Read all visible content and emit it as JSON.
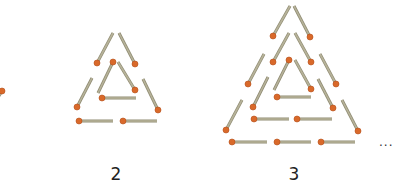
{
  "figure": {
    "colors": {
      "stick": "#b7b39a",
      "stick_edge": "#8f8b72",
      "head": "#d9692a",
      "head_dark": "#b44e18",
      "text": "#222222"
    },
    "ellipsis": "...",
    "patterns": [
      {
        "id": "pattern-1",
        "label": "",
        "partial": true,
        "matches": [
          {
            "head": [
              2,
              91
            ],
            "tail": [
              -6,
              104
            ]
          }
        ]
      },
      {
        "id": "pattern-2",
        "label": "2",
        "label_pos": [
          116,
          166
        ],
        "matches": [
          {
            "head": [
              97,
              63
            ],
            "tail": [
              113,
              33
            ]
          },
          {
            "head": [
              135,
              64
            ],
            "tail": [
              119,
              33
            ]
          },
          {
            "head": [
              77,
              107
            ],
            "tail": [
              92,
              78
            ]
          },
          {
            "head": [
              158,
              110
            ],
            "tail": [
              143,
              79
            ]
          },
          {
            "head": [
              79,
              121
            ],
            "tail": [
              113,
              121
            ]
          },
          {
            "head": [
              123,
              121
            ],
            "tail": [
              157,
              121
            ]
          },
          {
            "head": [
              113,
              62
            ],
            "tail": [
              98,
              93
            ]
          },
          {
            "head": [
              135,
              90
            ],
            "tail": [
              118,
              62
            ]
          },
          {
            "head": [
              102,
              98
            ],
            "tail": [
              136,
              98
            ]
          }
        ]
      },
      {
        "id": "pattern-3",
        "label": "3",
        "label_pos": [
          294,
          166
        ],
        "matches": [
          {
            "head": [
              273,
              36
            ],
            "tail": [
              290,
              6
            ]
          },
          {
            "head": [
              310,
              37
            ],
            "tail": [
              294,
              6
            ]
          },
          {
            "head": [
              273,
              62
            ],
            "tail": [
              289,
              33
            ]
          },
          {
            "head": [
              311,
              62
            ],
            "tail": [
              295,
              33
            ]
          },
          {
            "head": [
              289,
              60
            ],
            "tail": [
              274,
              90
            ]
          },
          {
            "head": [
              311,
              89
            ],
            "tail": [
              295,
              60
            ]
          },
          {
            "head": [
              277,
              97
            ],
            "tail": [
              311,
              97
            ]
          },
          {
            "head": [
              248,
              84
            ],
            "tail": [
              264,
              54
            ]
          },
          {
            "head": [
              336,
              84
            ],
            "tail": [
              320,
              54
            ]
          },
          {
            "head": [
              253,
              107
            ],
            "tail": [
              268,
              77
            ]
          },
          {
            "head": [
              333,
              108
            ],
            "tail": [
              318,
              79
            ]
          },
          {
            "head": [
              254,
              119
            ],
            "tail": [
              289,
              119
            ]
          },
          {
            "head": [
              297,
              119
            ],
            "tail": [
              332,
              119
            ]
          },
          {
            "head": [
              226,
              130
            ],
            "tail": [
              242,
              100
            ]
          },
          {
            "head": [
              358,
              131
            ],
            "tail": [
              342,
              100
            ]
          },
          {
            "head": [
              232,
              142
            ],
            "tail": [
              267,
              142
            ]
          },
          {
            "head": [
              277,
              142
            ],
            "tail": [
              311,
              142
            ]
          },
          {
            "head": [
              321,
              142
            ],
            "tail": [
              355,
              142
            ]
          }
        ]
      }
    ],
    "ellipsis_pos": [
      379,
      136
    ]
  }
}
